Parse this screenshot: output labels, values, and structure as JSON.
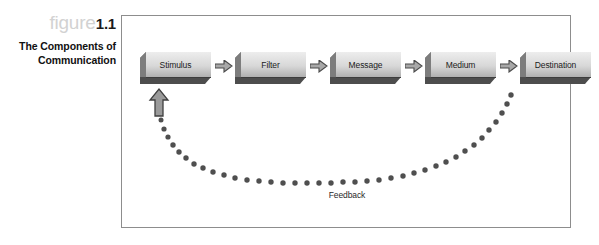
{
  "caption": {
    "figure_word": "figure",
    "figure_number": "1.1",
    "title_line1": "The Components of",
    "title_line2": "Communication"
  },
  "diagram": {
    "nodes": [
      {
        "label": "Stimulus"
      },
      {
        "label": "Filter"
      },
      {
        "label": "Message"
      },
      {
        "label": "Medium"
      },
      {
        "label": "Destination"
      }
    ],
    "arrow_icon": "right-block-arrow-icon",
    "feedback": {
      "label": "Feedback",
      "arrow_icon": "up-block-arrow-icon"
    }
  },
  "colors": {
    "frame_border": "#8d8d8d",
    "box_face_light": "#e6e6e6",
    "box_face_dark": "#a9a9a9",
    "box_shadow_edge": "#4d4d4d",
    "box_side": "#6f6f6f",
    "arrow_fill": "#a8a8a8",
    "arrow_outline": "#4a4a4a",
    "dot_color": "#4f4f4f",
    "figure_word": "#d2d2d2",
    "figure_number": "#1a1a1a",
    "text": "#1b1b1b"
  }
}
